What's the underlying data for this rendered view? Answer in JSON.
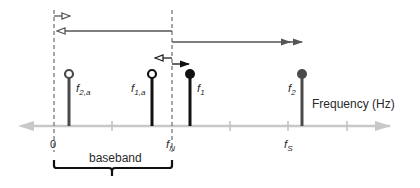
{
  "diagram": {
    "type": "frequency-domain aliasing illustration",
    "axis": {
      "label": "Frequency (Hz)",
      "ticks": [
        {
          "label": "0"
        },
        {
          "label": ""
        },
        {
          "label": "f",
          "sub": "N"
        },
        {
          "label": ""
        },
        {
          "label": "f",
          "sub": "S"
        },
        {
          "label": ""
        }
      ]
    },
    "stems": [
      {
        "id": "f2a",
        "label": "f",
        "sub": "2,a",
        "marker": "open",
        "color": "#4a4a4a"
      },
      {
        "id": "f1a",
        "label": "f",
        "sub": "1,a",
        "marker": "open",
        "color": "#111111"
      },
      {
        "id": "f1",
        "label": "f",
        "sub": "1",
        "marker": "filled",
        "color": "#111111"
      },
      {
        "id": "f2",
        "label": "f",
        "sub": "2",
        "marker": "filled",
        "color": "#4a4a4a"
      }
    ],
    "brace": {
      "label": "baseband"
    },
    "colors": {
      "axis": "#c8c8c8",
      "dashed": "#777777",
      "dark": "#111111",
      "gray": "#4a4a4a",
      "text": "#2a2a2a"
    }
  }
}
